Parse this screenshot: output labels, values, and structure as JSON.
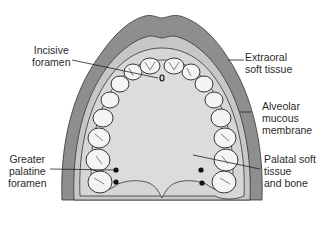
{
  "diagram": {
    "colors": {
      "extraoral": "#8e8e8e",
      "alveolar_mucosa": "#c7c7c7",
      "gingiva_band": "#d6d6d6",
      "palate": "#dcdcdc",
      "teeth": "#f4f4f4",
      "outline": "#222222",
      "background": "#ffffff"
    },
    "labels": {
      "incisive_foramen": [
        "Incisive",
        "foramen"
      ],
      "extraoral_soft_tissue": [
        "Extraoral",
        "soft tissue"
      ],
      "alveolar_mucous_membrane": [
        "Alveolar",
        "mucous",
        "membrane"
      ],
      "greater_palatine_foramen": [
        "Greater",
        "palatine",
        "foramen"
      ],
      "palatal_soft_tissue": [
        "Palatal soft",
        "tissue",
        "and bone"
      ]
    }
  }
}
